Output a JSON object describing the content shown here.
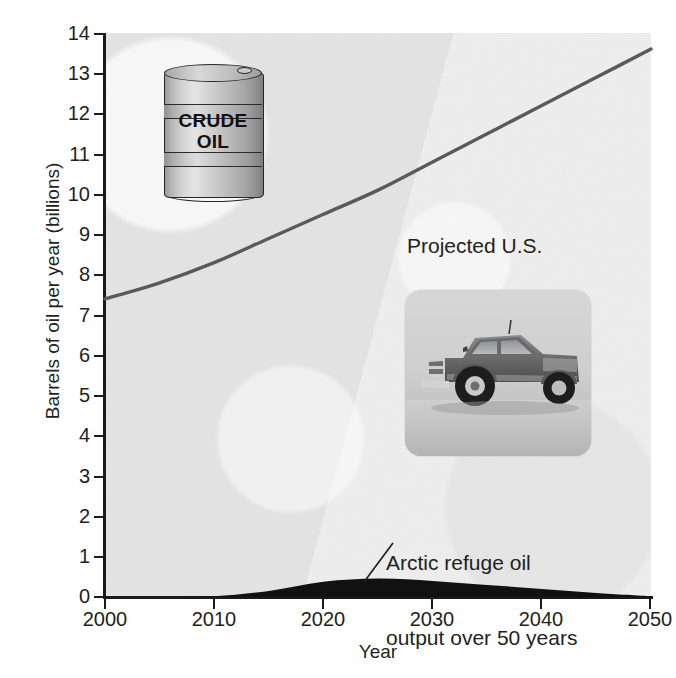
{
  "chart_data": {
    "type": "area",
    "title": "",
    "subtitle": "",
    "xlabel": "Year",
    "ylabel": "Barrels of oil per year (billions)",
    "xlim": [
      2000,
      2050
    ],
    "ylim": [
      0,
      14
    ],
    "grid": false,
    "legend_position": "none",
    "xticks": [
      "2000",
      "2010",
      "2020",
      "2030",
      "2040",
      "2050"
    ],
    "yticks": [
      "0",
      "1",
      "2",
      "3",
      "4",
      "5",
      "6",
      "7",
      "8",
      "9",
      "10",
      "11",
      "12",
      "13",
      "14"
    ],
    "x": [
      2000,
      2005,
      2010,
      2015,
      2020,
      2025,
      2030,
      2035,
      2040,
      2045,
      2050
    ],
    "series": [
      {
        "name": "Projected U.S. oil consumption",
        "type": "line",
        "color": "#5a5a5a",
        "values": [
          7.4,
          7.8,
          8.3,
          8.9,
          9.5,
          10.1,
          10.8,
          11.5,
          12.2,
          12.9,
          13.6
        ]
      },
      {
        "name": "Arctic refuge oil output over 50 years",
        "type": "area",
        "color": "#111111",
        "values": [
          0.0,
          0.0,
          0.02,
          0.15,
          0.38,
          0.46,
          0.4,
          0.3,
          0.2,
          0.1,
          0.02
        ]
      }
    ],
    "annotations": [
      {
        "name": "consumption-label",
        "text": "Projected U.S.\noil consumption",
        "line1": "Projected U.S.",
        "line2": "oil consumption",
        "x": 2030,
        "y": 9.9
      },
      {
        "name": "arctic-label",
        "text": "Arctic refuge oil\noutput over 50 years",
        "line1": "Arctic refuge oil",
        "line2": "output over 50 years",
        "x": 2026,
        "y": 2.1
      }
    ],
    "images": [
      {
        "name": "crude-oil-barrel",
        "caption_line1": "CRUDE",
        "caption_line2": "OIL"
      },
      {
        "name": "pickup-truck-photo",
        "caption": ""
      }
    ],
    "colors": {
      "plot_background": "#e8e8e8",
      "axis": "#1a1a1a",
      "consumption_line": "#5a5a5a",
      "arctic_area": "#111111",
      "text": "#231f20"
    }
  }
}
